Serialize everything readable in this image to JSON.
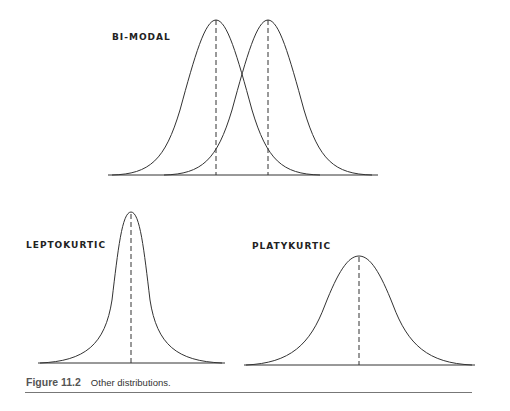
{
  "figure": {
    "number": "Figure 11.2",
    "caption": "Other distributions."
  },
  "panels": {
    "bimodal": {
      "label": "BI-MODAL"
    },
    "leptokurtic": {
      "label": "LEPTOKURTIC"
    },
    "platykurtic": {
      "label": "PLATYKURTIC"
    }
  },
  "colors": {
    "line": "#333333",
    "background": "#ffffff"
  }
}
